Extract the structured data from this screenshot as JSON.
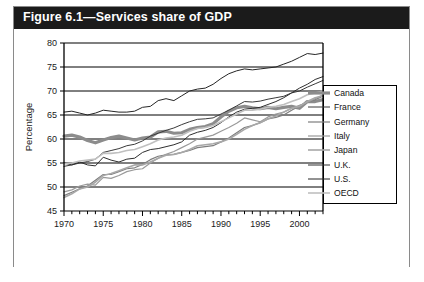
{
  "figure": {
    "title": "Figure 6.1—Services share of GDP"
  },
  "chart_data": {
    "type": "line",
    "title": "Figure 6.1—Services share of GDP",
    "xlabel": "",
    "ylabel": "Percentage",
    "xlim": [
      1970,
      2003
    ],
    "ylim": [
      45,
      80
    ],
    "yticks": [
      45,
      50,
      55,
      60,
      65,
      70,
      75,
      80
    ],
    "xticks": [
      1970,
      1975,
      1980,
      1985,
      1990,
      1995,
      2000
    ],
    "xtick_labels": [
      "1970",
      "1975",
      "1980",
      "1985",
      "1990",
      "1995",
      "2000"
    ],
    "ytick_labels": [
      "45",
      "50",
      "55",
      "60",
      "65",
      "70",
      "75",
      "80"
    ],
    "minor_xticks_every": 1,
    "grid": "horizontal",
    "legend_position": "right-inside",
    "x": [
      1970,
      1971,
      1972,
      1973,
      1974,
      1975,
      1976,
      1977,
      1978,
      1979,
      1980,
      1981,
      1982,
      1983,
      1984,
      1985,
      1986,
      1987,
      1988,
      1989,
      1990,
      1991,
      1992,
      1993,
      1994,
      1995,
      1996,
      1997,
      1998,
      1999,
      2000,
      2001,
      2002,
      2003
    ],
    "series": [
      {
        "name": "Canada",
        "color": "#8c8c8c",
        "width": 3.2,
        "values": [
          60.6,
          60.8,
          60.4,
          59.7,
          59.2,
          59.8,
          60.3,
          60.6,
          60.2,
          59.8,
          60.2,
          60.4,
          61.5,
          61.6,
          61.2,
          61.3,
          62.0,
          62.4,
          62.6,
          63.2,
          64.6,
          65.8,
          66.5,
          66.8,
          66.5,
          66.3,
          66.6,
          66.3,
          66.6,
          66.8,
          66.4,
          67.8,
          67.8,
          68.2
        ]
      },
      {
        "name": "France",
        "color": "#3a3a3a",
        "width": 1.0,
        "values": [
          54.3,
          54.6,
          55.0,
          55.3,
          55.8,
          57.2,
          57.6,
          58.0,
          58.6,
          58.9,
          59.6,
          60.6,
          61.2,
          61.8,
          62.3,
          63.0,
          63.6,
          64.1,
          64.2,
          64.4,
          65.2,
          66.0,
          66.9,
          67.8,
          67.7,
          67.9,
          68.3,
          68.6,
          68.9,
          69.6,
          70.0,
          70.8,
          71.5,
          72.2
        ]
      },
      {
        "name": "Germany",
        "color": "#7d7d7d",
        "width": 1.2,
        "values": [
          48.2,
          48.9,
          49.6,
          50.2,
          51.4,
          52.6,
          52.6,
          53.2,
          53.8,
          54.0,
          54.7,
          55.7,
          56.4,
          56.7,
          56.8,
          57.2,
          57.6,
          58.2,
          58.4,
          58.6,
          59.4,
          60.2,
          61.3,
          62.4,
          62.8,
          63.4,
          64.2,
          64.5,
          65.0,
          66.0,
          66.9,
          67.6,
          68.2,
          68.9
        ]
      },
      {
        "name": "Italy",
        "color": "#9a9a9a",
        "width": 1.2,
        "values": [
          49.0,
          49.4,
          50.2,
          50.6,
          50.4,
          52.0,
          51.8,
          52.4,
          53.2,
          53.6,
          53.8,
          55.0,
          56.0,
          56.8,
          57.4,
          58.2,
          59.0,
          60.0,
          60.4,
          60.8,
          61.6,
          62.4,
          63.3,
          64.4,
          64.0,
          63.6,
          64.6,
          65.2,
          65.6,
          66.4,
          67.0,
          67.6,
          68.4,
          69.2
        ]
      },
      {
        "name": "Japan",
        "color": "#a8a8a8",
        "width": 1.6,
        "values": [
          47.8,
          48.6,
          49.6,
          50.0,
          51.0,
          52.4,
          52.8,
          53.4,
          54.0,
          54.6,
          54.6,
          55.2,
          56.0,
          56.6,
          56.8,
          57.2,
          57.8,
          58.6,
          58.8,
          59.0,
          59.4,
          60.0,
          61.0,
          62.0,
          62.8,
          63.4,
          64.2,
          64.8,
          65.6,
          66.4,
          66.8,
          67.8,
          68.6,
          69.0
        ]
      },
      {
        "name": "U.K.",
        "color": "#2e2e2e",
        "width": 1.0,
        "values": [
          55.0,
          54.6,
          55.2,
          54.6,
          54.4,
          56.2,
          55.6,
          55.2,
          55.8,
          56.0,
          57.2,
          57.8,
          58.0,
          58.4,
          58.8,
          59.4,
          60.8,
          61.4,
          61.8,
          62.4,
          63.4,
          64.6,
          65.6,
          66.2,
          66.4,
          66.6,
          67.2,
          67.8,
          68.6,
          69.6,
          70.6,
          71.4,
          72.4,
          73.0
        ]
      },
      {
        "name": "U.S.",
        "color": "#262626",
        "width": 1.0,
        "values": [
          65.6,
          65.8,
          65.4,
          65.0,
          65.4,
          66.0,
          65.8,
          65.6,
          65.6,
          65.8,
          66.6,
          66.8,
          68.0,
          68.4,
          68.0,
          69.0,
          70.0,
          70.4,
          70.6,
          71.4,
          72.6,
          73.6,
          74.2,
          74.6,
          74.4,
          74.6,
          74.8,
          75.0,
          75.6,
          76.2,
          77.0,
          77.8,
          77.6,
          77.9
        ]
      },
      {
        "name": "OECD",
        "color": "#c0c0c0",
        "width": 1.6,
        "values": [
          54.8,
          55.0,
          55.4,
          55.6,
          55.8,
          57.0,
          57.0,
          57.2,
          57.6,
          57.8,
          58.4,
          59.0,
          59.8,
          60.2,
          60.4,
          60.8,
          61.6,
          62.2,
          62.4,
          62.8,
          63.6,
          64.4,
          65.2,
          66.0,
          66.0,
          66.2,
          66.6,
          66.8,
          67.2,
          67.8,
          68.4,
          69.2,
          69.6,
          70.0
        ]
      }
    ]
  }
}
